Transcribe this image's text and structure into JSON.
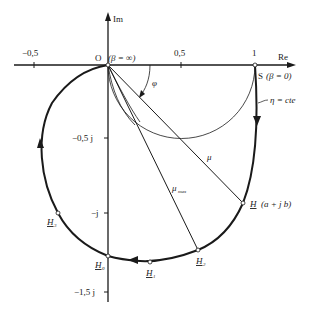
{
  "diagram": {
    "type": "complex-plane locus diagram",
    "axes": {
      "real_axis_label": "Re",
      "imag_axis_label": "Im",
      "real_ticks": [
        {
          "value": -0.5,
          "label": "−0,5"
        },
        {
          "value": 0.5,
          "label": "0,5"
        },
        {
          "value": 1,
          "label": "1"
        }
      ],
      "imag_ticks": [
        {
          "value": -0.5,
          "label": "−0,5 j"
        },
        {
          "value": -1,
          "label": "−j"
        },
        {
          "value": -1.5,
          "label": "−1,5 j"
        }
      ]
    },
    "points": {
      "origin": {
        "label": "O",
        "annotation": "(β = ∞)"
      },
      "S": {
        "label": "S",
        "annotation": "(β = 0)"
      },
      "H": {
        "label": "H",
        "annotation": "(a + j b)"
      },
      "H0": {
        "label": "H",
        "sub": "0"
      },
      "H1": {
        "label": "H",
        "sub": "1"
      },
      "H2": {
        "label": "H",
        "sub": "2"
      },
      "H3": {
        "label": "H",
        "sub": "3"
      }
    },
    "annotations": {
      "phi": "φ",
      "mu": "μ",
      "mu_max": "μ",
      "mu_max_sub": "max",
      "eta": "η = cte"
    }
  }
}
